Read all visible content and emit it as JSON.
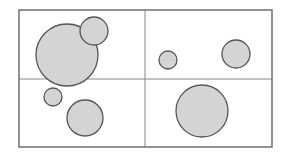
{
  "figure": {
    "background_color": "#ffffff",
    "canvas": {
      "width": 287,
      "height": 158
    }
  },
  "chart_data": {
    "type": "scatter",
    "title": "",
    "subtitle": "",
    "xlabel": "",
    "ylabel": "",
    "grid": true,
    "legend": null,
    "xlim": [
      19,
      272
    ],
    "ylim": [
      10,
      147
    ],
    "frame": {
      "x": 19,
      "y": 10,
      "width": 253,
      "height": 137,
      "stroke_color": "#666666",
      "stroke_width": 1.4,
      "fill_color": "#ffffff"
    },
    "dividers": {
      "stroke_color": "#888888",
      "stroke_width": 1,
      "vertical_x": [
        145
      ],
      "horizontal_y": [
        79
      ]
    },
    "cells": [
      {
        "name": "top-left",
        "x": 19,
        "y": 10,
        "width": 126,
        "height": 69,
        "circle_count": 2
      },
      {
        "name": "top-right",
        "x": 145,
        "y": 10,
        "width": 127,
        "height": 69,
        "circle_count": 2
      },
      {
        "name": "bottom-left",
        "x": 19,
        "y": 79,
        "width": 126,
        "height": 68,
        "circle_count": 2
      },
      {
        "name": "bottom-right",
        "x": 145,
        "y": 79,
        "width": 127,
        "height": 68,
        "circle_count": 1
      }
    ],
    "circle_style": {
      "fill_color": "#d4d4d4",
      "stroke_color": "#555555",
      "stroke_width": 1.3
    },
    "circles": [
      {
        "id": "c1",
        "cell": "top-left",
        "cx": 67,
        "cy": 55,
        "r": 31,
        "size_label": "large"
      },
      {
        "id": "c2",
        "cell": "top-left",
        "cx": 94,
        "cy": 31,
        "r": 14,
        "size_label": "small"
      },
      {
        "id": "c3",
        "cell": "top-right",
        "cx": 168,
        "cy": 60,
        "r": 9,
        "size_label": "tiny"
      },
      {
        "id": "c4",
        "cell": "top-right",
        "cx": 236,
        "cy": 54,
        "r": 14,
        "size_label": "small"
      },
      {
        "id": "c5",
        "cell": "bottom-left",
        "cx": 53,
        "cy": 97,
        "r": 9,
        "size_label": "tiny"
      },
      {
        "id": "c6",
        "cell": "bottom-left",
        "cx": 85,
        "cy": 118,
        "r": 18,
        "size_label": "medium"
      },
      {
        "id": "c7",
        "cell": "bottom-right",
        "cx": 202,
        "cy": 111,
        "r": 26,
        "size_label": "large"
      }
    ]
  }
}
